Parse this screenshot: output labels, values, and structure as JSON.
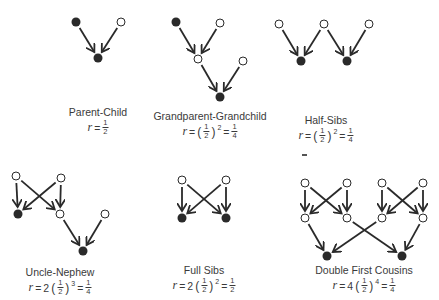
{
  "diagrams": [
    {
      "id": "parent-child",
      "title": "Parent-Child",
      "formula": {
        "coef": "",
        "base": "1/2",
        "exp": "",
        "result": "1/2",
        "simple": true
      },
      "nodes": [
        {
          "x": 76,
          "y": 22,
          "filled": true
        },
        {
          "x": 121,
          "y": 22,
          "filled": false
        },
        {
          "x": 98,
          "y": 58,
          "filled": true
        }
      ],
      "edges": [
        [
          0,
          2
        ],
        [
          1,
          2
        ]
      ]
    },
    {
      "id": "grandparent-grandchild",
      "title": "Grandparent-Grandchild",
      "formula": {
        "coef": "",
        "base": "1/2",
        "exp": "2",
        "result": "1/4"
      },
      "nodes": [
        {
          "x": 176,
          "y": 22,
          "filled": true
        },
        {
          "x": 220,
          "y": 23,
          "filled": false
        },
        {
          "x": 198,
          "y": 59,
          "filled": false
        },
        {
          "x": 243,
          "y": 61,
          "filled": false
        },
        {
          "x": 220,
          "y": 97,
          "filled": true
        }
      ],
      "edges": [
        [
          0,
          2
        ],
        [
          1,
          2
        ],
        [
          2,
          4
        ],
        [
          3,
          4
        ]
      ]
    },
    {
      "id": "half-sibs",
      "title": "Half-Sibs",
      "formula": {
        "coef": "",
        "base": "1/2",
        "exp": "2",
        "result": "1/4"
      },
      "nodes": [
        {
          "x": 279,
          "y": 24,
          "filled": false
        },
        {
          "x": 324,
          "y": 24,
          "filled": false
        },
        {
          "x": 369,
          "y": 24,
          "filled": false
        },
        {
          "x": 301,
          "y": 61,
          "filled": true
        },
        {
          "x": 347,
          "y": 61,
          "filled": true
        }
      ],
      "edges": [
        [
          0,
          3
        ],
        [
          1,
          3
        ],
        [
          1,
          4
        ],
        [
          2,
          4
        ]
      ]
    },
    {
      "id": "uncle-nephew",
      "title": "Uncle-Nephew",
      "formula": {
        "coef": "2",
        "base": "1/2",
        "exp": "3",
        "result": "1/4"
      },
      "nodes": [
        {
          "x": 16,
          "y": 176,
          "filled": false
        },
        {
          "x": 61,
          "y": 178,
          "filled": false
        },
        {
          "x": 18,
          "y": 214,
          "filled": true
        },
        {
          "x": 60,
          "y": 214,
          "filled": false
        },
        {
          "x": 105,
          "y": 214,
          "filled": false
        },
        {
          "x": 83,
          "y": 251,
          "filled": true
        }
      ],
      "edges": [
        [
          0,
          2
        ],
        [
          0,
          3
        ],
        [
          1,
          2
        ],
        [
          1,
          3
        ],
        [
          3,
          5
        ],
        [
          4,
          5
        ]
      ]
    },
    {
      "id": "full-sibs",
      "title": "Full Sibs",
      "formula": {
        "coef": "2",
        "base": "1/2",
        "exp": "2",
        "result": "1/2"
      },
      "nodes": [
        {
          "x": 182,
          "y": 180,
          "filled": false
        },
        {
          "x": 226,
          "y": 180,
          "filled": false
        },
        {
          "x": 182,
          "y": 218,
          "filled": true
        },
        {
          "x": 226,
          "y": 218,
          "filled": true
        }
      ],
      "edges": [
        [
          0,
          2
        ],
        [
          0,
          3
        ],
        [
          1,
          2
        ],
        [
          1,
          3
        ]
      ]
    },
    {
      "id": "double-first-cousins",
      "title": "Double First Cousins",
      "formula": {
        "coef": "4",
        "base": "1/2",
        "exp": "4",
        "result": "1/4"
      },
      "nodes": [
        {
          "x": 305,
          "y": 183,
          "filled": false
        },
        {
          "x": 347,
          "y": 183,
          "filled": false
        },
        {
          "x": 382,
          "y": 183,
          "filled": false
        },
        {
          "x": 423,
          "y": 183,
          "filled": false
        },
        {
          "x": 305,
          "y": 218,
          "filled": false
        },
        {
          "x": 347,
          "y": 218,
          "filled": false
        },
        {
          "x": 382,
          "y": 218,
          "filled": false
        },
        {
          "x": 423,
          "y": 218,
          "filled": false
        },
        {
          "x": 327,
          "y": 256,
          "filled": true
        },
        {
          "x": 402,
          "y": 256,
          "filled": true
        }
      ],
      "edges": [
        [
          0,
          4
        ],
        [
          0,
          5
        ],
        [
          1,
          4
        ],
        [
          1,
          5
        ],
        [
          2,
          6
        ],
        [
          2,
          7
        ],
        [
          3,
          6
        ],
        [
          3,
          7
        ],
        [
          4,
          8
        ],
        [
          6,
          8
        ],
        [
          5,
          9
        ],
        [
          7,
          9
        ]
      ]
    }
  ],
  "labels": {
    "parent_child": {
      "title": "Parent-Child",
      "r": "r",
      "eq": "=",
      "num": "1",
      "den": "2"
    },
    "grandparent": {
      "title": "Grandparent-Grandchild",
      "r": "r",
      "eq": "=",
      "open": "(",
      "num": "1",
      "den": "2",
      "close": ")",
      "exp": "2",
      "eq2": "=",
      "rnum": "1",
      "rden": "4"
    },
    "half_sibs": {
      "title": "Half-Sibs",
      "r": "r",
      "eq": "=",
      "open": "(",
      "num": "1",
      "den": "2",
      "close": ")",
      "exp": "2",
      "eq2": "=",
      "rnum": "1",
      "rden": "4"
    },
    "uncle_nephew": {
      "title": "Uncle-Nephew",
      "r": "r",
      "eq": "=",
      "coef": "2",
      "open": "(",
      "num": "1",
      "den": "2",
      "close": ")",
      "exp": "3",
      "eq2": "=",
      "rnum": "1",
      "rden": "4"
    },
    "full_sibs": {
      "title": "Full Sibs",
      "r": "r",
      "eq": "=",
      "coef": "2",
      "open": "(",
      "num": "1",
      "den": "2",
      "close": ")",
      "exp": "2",
      "eq2": "=",
      "rnum": "1",
      "rden": "2"
    },
    "double_cousins": {
      "title": "Double First Cousins",
      "r": "r",
      "eq": "=",
      "coef": "4",
      "open": "(",
      "num": "1",
      "den": "2",
      "close": ")",
      "exp": "4",
      "eq2": "=",
      "rnum": "1",
      "rden": "4"
    }
  },
  "colors": {
    "ink": "#2a2a2a",
    "text": "#3a3a3a",
    "background": "#ffffff"
  }
}
